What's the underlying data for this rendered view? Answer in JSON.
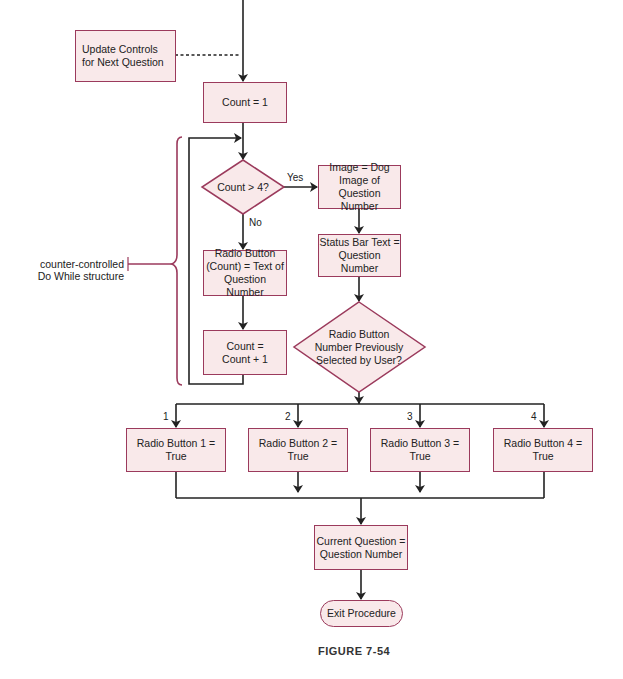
{
  "diagram": {
    "type": "flowchart",
    "caption": "FIGURE 7-54",
    "colors": {
      "node_fill": "#f9e9ea",
      "node_border": "#9b3a5c",
      "line": "#222222",
      "bracket": "#9b3a5c"
    },
    "side_note": {
      "line1": "counter-controlled",
      "line2": "Do While structure"
    },
    "nodes": {
      "update_controls": {
        "line1": "Update Controls",
        "line2": "for Next Question"
      },
      "count_init": {
        "line1": "Count = 1"
      },
      "decision_count": {
        "line1": "Count > 4?"
      },
      "image_dog": {
        "line1": "Image = Dog",
        "line2": "Image of",
        "line3": "Question Number"
      },
      "radio_text": {
        "line1": "Radio Button",
        "line2": "(Count) = Text of",
        "line3": "Question Number"
      },
      "count_increment": {
        "line1": "Count =",
        "line2": "Count + 1"
      },
      "status_bar": {
        "line1": "Status Bar Text =",
        "line2": "Question Number"
      },
      "decision_selected": {
        "line1": "Radio Button",
        "line2": "Number Previously",
        "line3": "Selected by User?"
      },
      "radio1": {
        "line1": "Radio Button 1 =",
        "line2": "True"
      },
      "radio2": {
        "line1": "Radio Button 2 =",
        "line2": "True"
      },
      "radio3": {
        "line1": "Radio Button 3 =",
        "line2": "True"
      },
      "radio4": {
        "line1": "Radio Button 4 =",
        "line2": "True"
      },
      "current_question": {
        "line1": "Current Question =",
        "line2": "Question Number"
      },
      "exit": {
        "line1": "Exit Procedure"
      }
    },
    "edge_labels": {
      "yes": "Yes",
      "no": "No",
      "case1": "1",
      "case2": "2",
      "case3": "3",
      "case4": "4"
    }
  }
}
